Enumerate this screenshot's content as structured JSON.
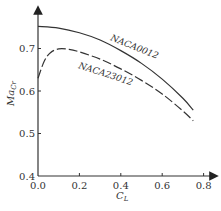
{
  "chart_data": {
    "type": "line",
    "title": "",
    "xlabel": "C_L",
    "ylabel": "Ma_Cr",
    "xlim": [
      0.0,
      0.85
    ],
    "ylim": [
      0.4,
      0.78
    ],
    "grid": false,
    "legend": "inline labels on curves",
    "x_ticks": [
      "0.0",
      "0.2",
      "0.4",
      "0.6",
      "0.8"
    ],
    "y_ticks": [
      "0.4",
      "0.5",
      "0.6",
      "0.7"
    ],
    "series": [
      {
        "name": "NACA0012",
        "style": "solid",
        "x": [
          0.0,
          0.1,
          0.2,
          0.3,
          0.4,
          0.5,
          0.6,
          0.7,
          0.75
        ],
        "y": [
          0.752,
          0.748,
          0.737,
          0.72,
          0.695,
          0.665,
          0.628,
          0.583,
          0.555
        ]
      },
      {
        "name": "NACA23012",
        "style": "dashed",
        "x": [
          0.0,
          0.03,
          0.06,
          0.1,
          0.15,
          0.2,
          0.3,
          0.4,
          0.5,
          0.6,
          0.7,
          0.75
        ],
        "y": [
          0.63,
          0.67,
          0.69,
          0.699,
          0.698,
          0.692,
          0.675,
          0.652,
          0.625,
          0.593,
          0.553,
          0.53
        ]
      }
    ]
  },
  "labels": {
    "x_axis": "C",
    "x_axis_sub": "L",
    "y_axis": "Ma",
    "y_axis_sub": "Cr",
    "series_0": "NACA0012",
    "series_1": "NACA23012"
  }
}
